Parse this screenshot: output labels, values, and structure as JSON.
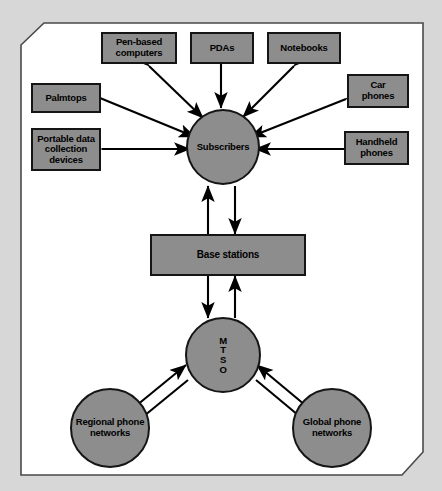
{
  "figure": {
    "page_background": "#ffffff",
    "canvas_background": "#d7d7d7",
    "node_fill": "#8d8d8d",
    "node_stroke": "#151515",
    "arrow_color": "#000000",
    "page_border_color": "#4a4a4a"
  },
  "nodes": {
    "pen_based_computers": {
      "label": "Pen-based\ncomputers",
      "shape": "box"
    },
    "pdas": {
      "label": "PDAs",
      "shape": "box"
    },
    "notebooks": {
      "label": "Notebooks",
      "shape": "box"
    },
    "palmtops": {
      "label": "Palmtops",
      "shape": "box"
    },
    "portable_data_collection_devices": {
      "label": "Portable data\ncollection\ndevices",
      "shape": "box"
    },
    "car_phones": {
      "label": "Car\nphones",
      "shape": "box"
    },
    "handheld_phones": {
      "label": "Handheld\nphones",
      "shape": "box"
    },
    "subscribers": {
      "label": "Subscribers",
      "shape": "circle"
    },
    "base_stations": {
      "label": "Base stations",
      "shape": "box"
    },
    "mtso": {
      "label": "MTSO",
      "letters": [
        "M",
        "T",
        "S",
        "O"
      ],
      "shape": "circle"
    },
    "regional_phone_networks": {
      "label": "Regional phone\nnetworks",
      "shape": "circle"
    },
    "global_phone_networks": {
      "label": "Global phone\nnetworks",
      "shape": "circle"
    }
  },
  "edges": [
    {
      "from": "pen_based_computers",
      "to": "subscribers",
      "style": "double-arrow"
    },
    {
      "from": "pdas",
      "to": "subscribers",
      "style": "double-arrow"
    },
    {
      "from": "notebooks",
      "to": "subscribers",
      "style": "double-arrow"
    },
    {
      "from": "palmtops",
      "to": "subscribers",
      "style": "double-arrow"
    },
    {
      "from": "portable_data_collection_devices",
      "to": "subscribers",
      "style": "double-arrow"
    },
    {
      "from": "car_phones",
      "to": "subscribers",
      "style": "double-arrow"
    },
    {
      "from": "handheld_phones",
      "to": "subscribers",
      "style": "double-arrow"
    },
    {
      "from": "subscribers",
      "to": "base_stations",
      "style": "two-single-arrows"
    },
    {
      "from": "base_stations",
      "to": "mtso",
      "style": "two-single-arrows"
    },
    {
      "from": "mtso",
      "to": "regional_phone_networks",
      "style": "two-single-arrows"
    },
    {
      "from": "mtso",
      "to": "global_phone_networks",
      "style": "two-single-arrows"
    }
  ]
}
